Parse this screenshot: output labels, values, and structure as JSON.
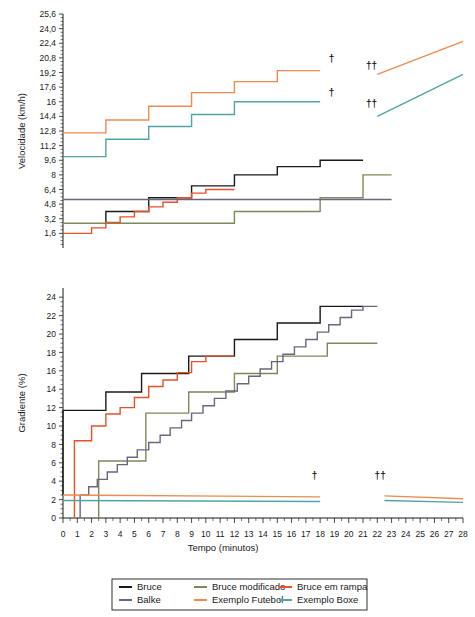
{
  "figure": {
    "title": "",
    "background": "#ffffff"
  },
  "colors": {
    "bruce": "#1a1a1a",
    "bruce_modificado": "#7a8a5a",
    "bruce_em_rampa": "#e8502a",
    "balke": "#6e6480",
    "exemplo_futebol": "#ef8b4e",
    "exemplo_boxe": "#52a3a3",
    "axis": "#1a1a1a",
    "text": "#1a1a1a"
  },
  "legend": {
    "position": "bottom",
    "entries": [
      {
        "label": "Bruce",
        "color_key": "bruce"
      },
      {
        "label": "Bruce modificado",
        "color_key": "bruce_modificado"
      },
      {
        "label": "Bruce em rampa",
        "color_key": "bruce_em_rampa"
      },
      {
        "label": "Balke",
        "color_key": "balke"
      },
      {
        "label": "Exemplo Futebol",
        "color_key": "exemplo_futebol"
      },
      {
        "label": "Exemplo Boxe",
        "color_key": "exemplo_boxe"
      }
    ]
  },
  "annotations": {
    "dagger": "†",
    "double_dagger": "††"
  },
  "chart_data": [
    {
      "id": "velocidade",
      "type": "line",
      "title": "",
      "xlabel": "",
      "ylabel": "Velocidade (km/h)",
      "xlim": [
        0,
        28
      ],
      "ylim": [
        0,
        25.6
      ],
      "grid": false,
      "x_tick_labels": [],
      "y_tick_labels": [
        "1,6",
        "3,2",
        "4,8",
        "6,4",
        "8",
        "9,6",
        "11,2",
        "12,8",
        "14,4",
        "16",
        "17,6",
        "19,2",
        "20,8",
        "22,4",
        "24,0",
        "25,6"
      ],
      "y_tick_values": [
        1.6,
        3.2,
        4.8,
        6.4,
        8,
        9.6,
        11.2,
        12.8,
        14.4,
        16,
        17.6,
        19.2,
        20.8,
        22.4,
        24.0,
        25.6
      ],
      "series": [
        {
          "name": "Bruce",
          "color_key": "bruce",
          "step": true,
          "points": [
            [
              3,
              2.7
            ],
            [
              3,
              4.0
            ],
            [
              6,
              4.0
            ],
            [
              6,
              5.5
            ],
            [
              9,
              5.5
            ],
            [
              9,
              6.8
            ],
            [
              12,
              6.8
            ],
            [
              12,
              8.0
            ],
            [
              15,
              8.0
            ],
            [
              15,
              8.9
            ],
            [
              18,
              8.9
            ],
            [
              18,
              9.6
            ],
            [
              21,
              9.6
            ]
          ]
        },
        {
          "name": "Bruce modificado",
          "color_key": "bruce_modificado",
          "step": true,
          "points": [
            [
              0,
              2.7
            ],
            [
              12,
              2.7
            ],
            [
              12,
              4.0
            ],
            [
              18,
              4.0
            ],
            [
              18,
              5.5
            ],
            [
              21,
              5.5
            ],
            [
              21,
              8.0
            ],
            [
              23,
              8.0
            ]
          ]
        },
        {
          "name": "Bruce em rampa",
          "color_key": "bruce_em_rampa",
          "step": true,
          "points": [
            [
              0,
              1.6
            ],
            [
              2,
              1.6
            ],
            [
              2,
              2.2
            ],
            [
              3,
              2.2
            ],
            [
              3,
              2.8
            ],
            [
              4,
              2.8
            ],
            [
              4,
              3.4
            ],
            [
              5,
              3.4
            ],
            [
              5,
              4.0
            ],
            [
              6,
              4.0
            ],
            [
              6,
              4.5
            ],
            [
              7,
              4.5
            ],
            [
              7,
              5.0
            ],
            [
              8,
              5.0
            ],
            [
              8,
              5.5
            ],
            [
              9,
              5.5
            ],
            [
              9,
              6.0
            ],
            [
              10,
              6.0
            ],
            [
              10,
              6.4
            ],
            [
              12,
              6.4
            ]
          ]
        },
        {
          "name": "Balke",
          "color_key": "balke",
          "step": false,
          "points": [
            [
              0,
              5.3
            ],
            [
              23,
              5.3
            ]
          ]
        },
        {
          "name": "Exemplo Futebol",
          "color_key": "exemplo_futebol",
          "step": true,
          "points": [
            [
              0,
              12.6
            ],
            [
              3,
              12.6
            ],
            [
              3,
              14.0
            ],
            [
              6,
              14.0
            ],
            [
              6,
              15.5
            ],
            [
              9,
              15.5
            ],
            [
              9,
              17.0
            ],
            [
              12,
              17.0
            ],
            [
              12,
              18.2
            ],
            [
              15,
              18.2
            ],
            [
              15,
              19.4
            ],
            [
              18,
              19.4
            ]
          ]
        },
        {
          "name": "Exemplo Futebol (continuacao)",
          "color_key": "exemplo_futebol",
          "step": false,
          "points": [
            [
              22,
              19.0
            ],
            [
              28,
              22.6
            ]
          ]
        },
        {
          "name": "Exemplo Boxe",
          "color_key": "exemplo_boxe",
          "step": true,
          "points": [
            [
              0,
              10.0
            ],
            [
              3,
              10.0
            ],
            [
              3,
              11.9
            ],
            [
              6,
              11.9
            ],
            [
              6,
              13.3
            ],
            [
              9,
              13.3
            ],
            [
              9,
              14.6
            ],
            [
              12,
              14.6
            ],
            [
              12,
              16.0
            ],
            [
              15,
              16.0
            ],
            [
              15,
              16.0
            ],
            [
              18,
              16.0
            ]
          ]
        },
        {
          "name": "Exemplo Boxe (continuacao)",
          "color_key": "exemplo_boxe",
          "step": false,
          "points": [
            [
              22,
              14.4
            ],
            [
              28,
              19.0
            ]
          ]
        }
      ],
      "markers": [
        {
          "text": "†",
          "x": 18.8,
          "y": 20.3
        },
        {
          "text": "†",
          "x": 18.8,
          "y": 16.6
        },
        {
          "text": "††",
          "x": 21.6,
          "y": 19.6
        },
        {
          "text": "††",
          "x": 21.6,
          "y": 15.4
        }
      ]
    },
    {
      "id": "gradiente",
      "type": "line",
      "title": "",
      "xlabel": "Tempo (minutos)",
      "ylabel": "Gradiente (%)",
      "xlim": [
        0,
        28
      ],
      "ylim": [
        0,
        25
      ],
      "grid": false,
      "x_tick_labels": [
        "0",
        "1",
        "2",
        "3",
        "4",
        "5",
        "6",
        "7",
        "8",
        "9",
        "10",
        "11",
        "12",
        "13",
        "14",
        "15",
        "16",
        "17",
        "18",
        "19",
        "20",
        "21",
        "22",
        "23",
        "24",
        "25",
        "26",
        "27",
        "28"
      ],
      "y_tick_labels": [
        "0",
        "2",
        "4",
        "6",
        "8",
        "10",
        "12",
        "14",
        "16",
        "18",
        "20",
        "22",
        "24"
      ],
      "y_tick_values": [
        0,
        2,
        4,
        6,
        8,
        10,
        12,
        14,
        16,
        18,
        20,
        22,
        24
      ],
      "series": [
        {
          "name": "Bruce",
          "color_key": "bruce",
          "step": true,
          "points": [
            [
              0,
              2.5
            ],
            [
              0,
              11.7
            ],
            [
              3,
              11.7
            ],
            [
              3,
              13.7
            ],
            [
              5.5,
              13.7
            ],
            [
              5.5,
              15.7
            ],
            [
              8.8,
              15.7
            ],
            [
              8.8,
              17.6
            ],
            [
              12,
              17.6
            ],
            [
              12,
              19.4
            ],
            [
              15,
              19.4
            ],
            [
              15,
              21.2
            ],
            [
              18,
              21.2
            ],
            [
              18,
              23.0
            ],
            [
              21,
              23.0
            ]
          ]
        },
        {
          "name": "Bruce modificado",
          "color_key": "bruce_modificado",
          "step": true,
          "points": [
            [
              2.5,
              0
            ],
            [
              2.5,
              6.2
            ],
            [
              5.8,
              6.2
            ],
            [
              5.8,
              11.4
            ],
            [
              8.8,
              11.4
            ],
            [
              8.8,
              13.7
            ],
            [
              12,
              13.7
            ],
            [
              12,
              15.7
            ],
            [
              15,
              15.7
            ],
            [
              15,
              17.6
            ],
            [
              18.5,
              17.6
            ],
            [
              18.5,
              19.0
            ],
            [
              22,
              19.0
            ]
          ]
        },
        {
          "name": "Bruce em rampa",
          "color_key": "bruce_em_rampa",
          "step": true,
          "points": [
            [
              0.8,
              0
            ],
            [
              0.8,
              8.4
            ],
            [
              2,
              8.4
            ],
            [
              2,
              10.0
            ],
            [
              3,
              10.0
            ],
            [
              3,
              11.3
            ],
            [
              4,
              11.3
            ],
            [
              4,
              12.0
            ],
            [
              5,
              12.0
            ],
            [
              5,
              13.1
            ],
            [
              6,
              13.1
            ],
            [
              6,
              14.3
            ],
            [
              7,
              14.3
            ],
            [
              7,
              15.0
            ],
            [
              8,
              15.0
            ],
            [
              8,
              15.8
            ],
            [
              9,
              15.8
            ],
            [
              9,
              17.0
            ],
            [
              10,
              17.0
            ],
            [
              10,
              17.6
            ],
            [
              12,
              17.6
            ]
          ]
        },
        {
          "name": "Balke",
          "color_key": "balke",
          "step": true,
          "points": [
            [
              1.2,
              0
            ],
            [
              1.2,
              2.5
            ],
            [
              1.8,
              2.5
            ],
            [
              1.8,
              3.4
            ],
            [
              2.4,
              3.4
            ],
            [
              2.4,
              4.2
            ],
            [
              3.1,
              4.2
            ],
            [
              3.1,
              5.0
            ],
            [
              3.8,
              5.0
            ],
            [
              3.8,
              5.8
            ],
            [
              4.5,
              5.8
            ],
            [
              4.5,
              6.6
            ],
            [
              5.2,
              6.6
            ],
            [
              5.2,
              7.4
            ],
            [
              6,
              7.4
            ],
            [
              6,
              8.2
            ],
            [
              6.8,
              8.2
            ],
            [
              6.8,
              9.0
            ],
            [
              7.5,
              9.0
            ],
            [
              7.5,
              9.8
            ],
            [
              8.3,
              9.8
            ],
            [
              8.3,
              10.6
            ],
            [
              9,
              10.6
            ],
            [
              9,
              11.4
            ],
            [
              9.8,
              11.4
            ],
            [
              9.8,
              12.2
            ],
            [
              10.6,
              12.2
            ],
            [
              10.6,
              13.0
            ],
            [
              11.4,
              13.0
            ],
            [
              11.4,
              13.8
            ],
            [
              12.2,
              13.8
            ],
            [
              12.2,
              14.6
            ],
            [
              13,
              14.6
            ],
            [
              13,
              15.4
            ],
            [
              13.8,
              15.4
            ],
            [
              13.8,
              16.2
            ],
            [
              14.6,
              16.2
            ],
            [
              14.6,
              17.0
            ],
            [
              15.4,
              17.0
            ],
            [
              15.4,
              17.8
            ],
            [
              16.2,
              17.8
            ],
            [
              16.2,
              18.6
            ],
            [
              17,
              18.6
            ],
            [
              17,
              19.4
            ],
            [
              17.8,
              19.4
            ],
            [
              17.8,
              20.2
            ],
            [
              18.6,
              20.2
            ],
            [
              18.6,
              21.0
            ],
            [
              19.4,
              21.0
            ],
            [
              19.4,
              21.8
            ],
            [
              20.2,
              21.8
            ],
            [
              20.2,
              22.6
            ],
            [
              21,
              22.6
            ],
            [
              21,
              23.0
            ],
            [
              22,
              23.0
            ]
          ]
        },
        {
          "name": "Exemplo Futebol",
          "color_key": "exemplo_futebol",
          "step": false,
          "points": [
            [
              0,
              2.5
            ],
            [
              18,
              2.3
            ]
          ]
        },
        {
          "name": "Exemplo Futebol (continuacao)",
          "color_key": "exemplo_futebol",
          "step": false,
          "points": [
            [
              22.5,
              2.4
            ],
            [
              28,
              2.1
            ]
          ]
        },
        {
          "name": "Exemplo Boxe",
          "color_key": "exemplo_boxe",
          "step": false,
          "points": [
            [
              0,
              1.9
            ],
            [
              18,
              1.8
            ]
          ]
        },
        {
          "name": "Exemplo Boxe (continuacao)",
          "color_key": "exemplo_boxe",
          "step": false,
          "points": [
            [
              22.5,
              1.9
            ],
            [
              28,
              1.7
            ]
          ]
        }
      ],
      "markers": [
        {
          "text": "†",
          "x": 17.6,
          "y": 4.2
        },
        {
          "text": "††",
          "x": 22.2,
          "y": 4.2
        }
      ]
    }
  ]
}
